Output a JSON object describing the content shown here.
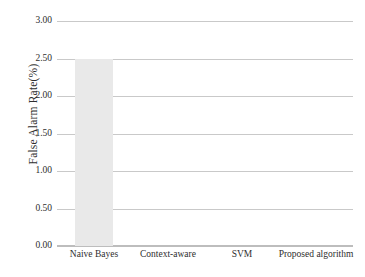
{
  "chart_data": {
    "type": "bar",
    "title": "",
    "subtitle": "",
    "xlabel": "",
    "ylabel": "False Alarm Rate(%)",
    "categories": [
      "Naive Bayes",
      "Context-aware",
      "SVM",
      "Proposed algorithm"
    ],
    "values": [
      2.5,
      0.0,
      0.0,
      0.0
    ],
    "series": [
      {
        "name": "False Alarm Rate(%)",
        "values": [
          2.5,
          0.0,
          0.0,
          0.0
        ],
        "color": "#e9e9e9"
      }
    ],
    "ylim": [
      0.0,
      3.0
    ],
    "ytick_step": 0.5,
    "ytick_labels": [
      "0.00",
      "0.50",
      "1.00",
      "1.50",
      "2.00",
      "2.50",
      "3.00"
    ],
    "ytick_values": [
      0.0,
      0.5,
      1.0,
      1.5,
      2.0,
      2.5,
      3.0
    ],
    "grid": true,
    "grid_axis": "y",
    "grid_color": "#c9c9c9",
    "legend": false,
    "legend_position": "none",
    "annotations": [],
    "bar_color": "#e9e9e9",
    "background_color": "#ffffff",
    "axis_color": "#bdbdbd"
  }
}
